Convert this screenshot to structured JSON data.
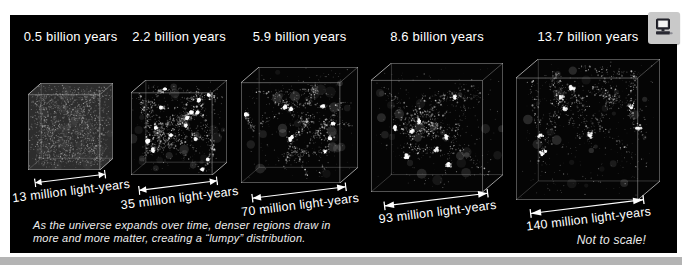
{
  "figure": {
    "panels": [
      {
        "age": "0.5 billion years",
        "scale": "13 million light-years"
      },
      {
        "age": "2.2 billion years",
        "scale": "35 million light-years"
      },
      {
        "age": "5.9 billion years",
        "scale": "70 million light-years"
      },
      {
        "age": "8.6 billion years",
        "scale": "93 million light-years"
      },
      {
        "age": "13.7 billion years",
        "scale": "140 million light-years"
      }
    ],
    "caption": {
      "line1": "As the universe expands over time, denser regions draw in",
      "line2": "more and more matter, creating a “lumpy” distribution."
    },
    "note": "Not to scale!",
    "icons": {
      "media": "computer-monitor-icon"
    },
    "colors": {
      "background": "#000000",
      "page": "#ffffff",
      "text": "#ffffff",
      "icon_box": "#c9c9c9",
      "bottom_strip": "#b4b4b4",
      "wireframe": "#c8c8c8"
    }
  }
}
